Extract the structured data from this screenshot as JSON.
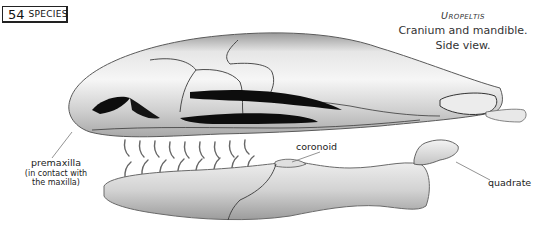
{
  "badge": {
    "number": "54",
    "label": "SPECIES"
  },
  "caption": {
    "genus": "Uropeltis",
    "line1": "Cranium and mandible.",
    "line2": "Side view."
  },
  "labels": {
    "premaxilla": "premaxilla",
    "premaxilla_note_1": "(in contact with",
    "premaxilla_note_2": "the maxilla)",
    "coronoid": "coronoid",
    "quadrate": "quadrate"
  },
  "colors": {
    "bone_light": "#f2f2f2",
    "bone_mid": "#cfcfcf",
    "bone_dark": "#8a8a8a",
    "suture": "#3a3a3a",
    "cavity": "#0d0d0d",
    "leader_line": "#777777"
  }
}
